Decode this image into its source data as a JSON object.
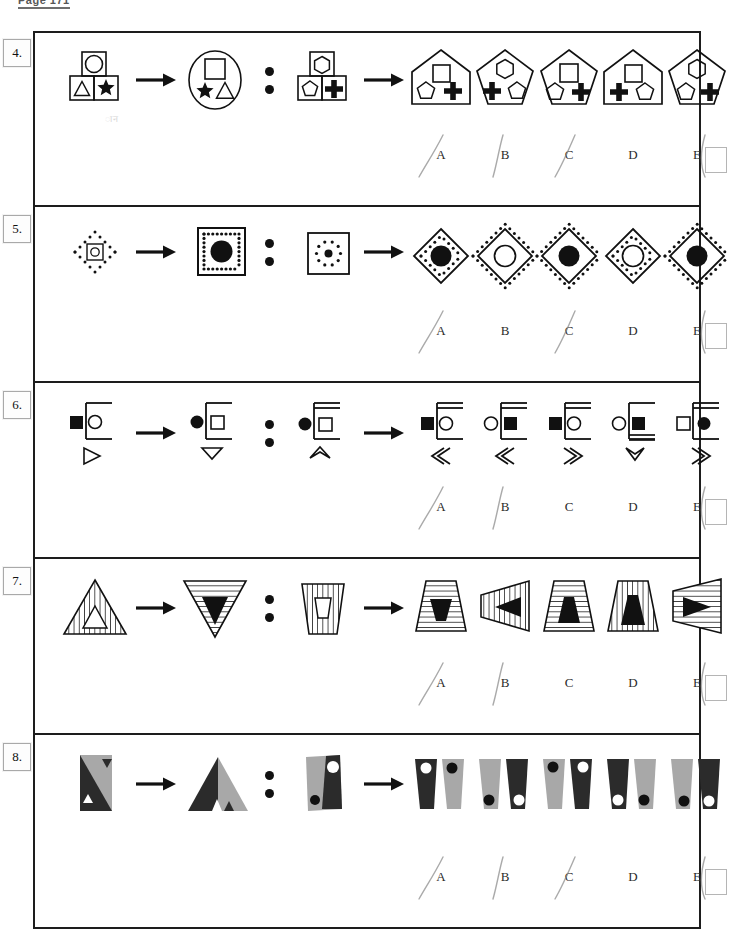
{
  "page": {
    "header": "Page 171",
    "ghost_mark": "ान"
  },
  "questions": [
    {
      "number": "4.",
      "type": "shape-container-analogy",
      "top": 31,
      "height": 176,
      "stimulus": {
        "a": "square-grid-circle-triangle-star",
        "b": "ellipse-square-star-triangle",
        "c": "square-grid-pentagon-hexagon-plus",
        "relation_symbol": ":"
      },
      "options": [
        {
          "label": "A",
          "shape": "house-square-pentagon-plus"
        },
        {
          "label": "B",
          "shape": "pentagon-hexagon-plus-pentagon"
        },
        {
          "label": "C",
          "shape": "pentagon-square-pentagon-plus"
        },
        {
          "label": "D",
          "shape": "house-square-plus-pentagon"
        },
        {
          "label": "E",
          "shape": "pentagon-hexagon-pentagon-plus"
        }
      ],
      "answer_labels": [
        "A",
        "B",
        "C",
        "D",
        "E"
      ],
      "marked": [
        "A",
        "B",
        "C",
        "E"
      ],
      "checkbox": true
    },
    {
      "number": "5.",
      "type": "dotted-frame-analogy",
      "top": 207,
      "height": 176,
      "stimulus": {
        "a": "dotted-diamond-small-open-circle",
        "b": "dotted-square-large-filled-circle",
        "c": "plain-square-dotted-ring-small-filled-circle",
        "relation_symbol": ":"
      },
      "options": [
        {
          "label": "A",
          "shape": "diamond-inner-dots-filled-circle"
        },
        {
          "label": "B",
          "shape": "diamond-outer-dots-open-circle"
        },
        {
          "label": "C",
          "shape": "diamond-outer-dots-filled-circle"
        },
        {
          "label": "D",
          "shape": "diamond-inner-dots-open-circle"
        },
        {
          "label": "E",
          "shape": "diamond-outer-dots-filled-circle-alt"
        }
      ],
      "answer_labels": [
        "A",
        "B",
        "C",
        "D",
        "E"
      ],
      "marked": [
        "A",
        "C",
        "D",
        "E"
      ],
      "checkbox": true
    },
    {
      "number": "6.",
      "type": "flag-pole-analogy",
      "top": 383,
      "height": 176,
      "stimulus": {
        "a": "pole-filled-square-open-circle-open-triangle",
        "b": "pole-filled-circle-open-square-open-down-triangle",
        "c": "double-pole-filled-circle-open-square-up-chevron",
        "relation_symbol": ":"
      },
      "options": [
        {
          "label": "A",
          "shape": "pole-filled-square-open-circle-left-double-chevron"
        },
        {
          "label": "B",
          "shape": "pole-open-circle-filled-square-left-double-chevron"
        },
        {
          "label": "C",
          "shape": "double-pole-filled-square-open-circle-right-chevron"
        },
        {
          "label": "D",
          "shape": "pole-open-circle-filled-square-down-chevron"
        },
        {
          "label": "E",
          "shape": "double-pole-open-square-filled-circle-right-chevron"
        }
      ],
      "answer_labels": [
        "A",
        "B",
        "C",
        "D",
        "E"
      ],
      "marked": [
        "A",
        "B",
        "D",
        "E"
      ],
      "checkbox": true
    },
    {
      "number": "7.",
      "type": "striped-trapezoid-analogy",
      "top": 559,
      "height": 176,
      "stimulus": {
        "a": "vertical-striped-triangle-open-inner-triangle",
        "b": "horizontal-striped-down-triangle-filled-inner-down-triangle",
        "c": "vertical-striped-trapezoid-open-inner-trapezoid",
        "relation_symbol": ":"
      },
      "options": [
        {
          "label": "A",
          "shape": "h-striped-trapezoid-filled-down-trapezoid"
        },
        {
          "label": "B",
          "shape": "v-striped-left-trapezoid-filled-left-arrow"
        },
        {
          "label": "C",
          "shape": "h-striped-trapezoid-filled-up-trapezoid"
        },
        {
          "label": "D",
          "shape": "v-striped-trapezoid-filled-up-trapezoid"
        },
        {
          "label": "E",
          "shape": "h-striped-right-trapezoid-filled-right-arrow"
        }
      ],
      "answer_labels": [
        "A",
        "B",
        "C",
        "D",
        "E"
      ],
      "marked": [
        "A",
        "B",
        "D",
        "E"
      ],
      "checkbox": true
    },
    {
      "number": "8.",
      "type": "split-panel-analogy",
      "top": 735,
      "height": 194,
      "stimulus": {
        "a": "rectangle-diagonal-grey-dark-two-triangles",
        "b": "triangle-dark-grey-two-small-triangles",
        "c": "quad-grey-dark-white-dot-dark-dot",
        "relation_symbol": ":"
      },
      "options": [
        {
          "label": "A",
          "shape": "dark-left-grey-right-white-dot-dark-dot"
        },
        {
          "label": "B",
          "shape": "grey-left-dark-right-dark-dot-white-dot"
        },
        {
          "label": "C",
          "shape": "grey-left-dark-right-dark-dot-white-dot-alt"
        },
        {
          "label": "D",
          "shape": "dark-left-grey-right-white-dot-dark-dot-alt"
        },
        {
          "label": "E",
          "shape": "grey-left-dark-right-dark-dot-white-dot-low"
        }
      ],
      "answer_labels": [
        "A",
        "B",
        "C",
        "D",
        "E"
      ],
      "marked": [
        "A",
        "B",
        "C",
        "E"
      ],
      "checkbox": true
    }
  ],
  "colors": {
    "ink": "#111111",
    "frame": "#1d1d1d",
    "grey_fill": "#a8a8a8",
    "dark_fill": "#2b2b2b",
    "pencil": "#8d8d8d"
  }
}
